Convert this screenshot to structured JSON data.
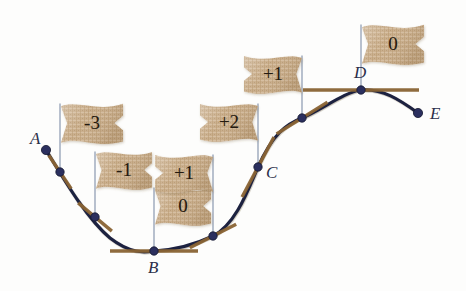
{
  "figure": {
    "background_color": "#fdfdfc",
    "curve_color": "#1d2140",
    "tangent_color": "#8a6434",
    "point_color": "#2b2f5e",
    "pole_color": "#9aa6bb",
    "flag_color": "#c9ad8a",
    "label_color": "#2b2f4a"
  },
  "curve": {
    "name": "slope-curve",
    "path": "M 46 150 C 62 176, 86 218, 110 238 C 132 255, 146 252, 154 251 C 176 250, 196 244, 213 236 C 236 224, 248 190, 258 167 C 272 135, 286 124, 302 118 C 322 110, 344 92, 361 90 C 382 88, 400 100, 418 113",
    "stroke_width": 3.2
  },
  "points": [
    {
      "id": "A",
      "label": "A",
      "x": 46,
      "y": 150,
      "label_x": 30,
      "label_y": 130,
      "slope_flag": null,
      "tangent_len": 0,
      "tangent_angle": 0,
      "endpoint": true
    },
    {
      "id": "P1",
      "label": "",
      "x": 60,
      "y": 172,
      "label_x": 0,
      "label_y": 0,
      "slope_flag": "-3",
      "tangent_len": 20,
      "tangent_angle": 56,
      "endpoint": false
    },
    {
      "id": "P2",
      "label": "",
      "x": 95,
      "y": 217,
      "label_x": 0,
      "label_y": 0,
      "slope_flag": "-1",
      "tangent_len": 22,
      "tangent_angle": 40,
      "endpoint": false
    },
    {
      "id": "B",
      "label": "B",
      "x": 154,
      "y": 251,
      "label_x": 148,
      "label_y": 259,
      "slope_flag": "0",
      "tangent_len": 44,
      "tangent_angle": 0,
      "endpoint": false
    },
    {
      "id": "P3",
      "label": "",
      "x": 213,
      "y": 236,
      "label_x": 0,
      "label_y": 0,
      "slope_flag": "+1",
      "tangent_len": 26,
      "tangent_angle": -27,
      "endpoint": false
    },
    {
      "id": "C",
      "label": "C",
      "x": 258,
      "y": 167,
      "label_x": 266,
      "label_y": 164,
      "slope_flag": "+2",
      "tangent_len": 34,
      "tangent_angle": -62,
      "endpoint": false
    },
    {
      "id": "P4",
      "label": "",
      "x": 302,
      "y": 118,
      "label_x": 0,
      "label_y": 0,
      "slope_flag": "+1",
      "tangent_len": 30,
      "tangent_angle": -32,
      "endpoint": false
    },
    {
      "id": "D",
      "label": "D",
      "x": 361,
      "y": 90,
      "label_x": 354,
      "label_y": 64,
      "slope_flag": "0",
      "tangent_len": 58,
      "tangent_angle": 0,
      "endpoint": false
    },
    {
      "id": "E",
      "label": "E",
      "x": 418,
      "y": 113,
      "label_x": 430,
      "label_y": 105,
      "slope_flag": null,
      "tangent_len": 0,
      "tangent_angle": 0,
      "endpoint": true
    }
  ],
  "flags": [
    {
      "id": "flag-minus3",
      "value": "-3",
      "pole_x": 60,
      "pole_top_y": 104,
      "pole_bottom_y": 172,
      "flag_x": 61,
      "flag_y": 105,
      "flag_w": 62,
      "flag_h": 36,
      "side": "right"
    },
    {
      "id": "flag-minus1",
      "value": "-1",
      "pole_x": 95,
      "pole_top_y": 152,
      "pole_bottom_y": 217,
      "flag_x": 96,
      "flag_y": 153,
      "flag_w": 56,
      "flag_h": 34,
      "side": "right"
    },
    {
      "id": "flag-zero-b",
      "value": "0",
      "pole_x": 154,
      "pole_top_y": 188,
      "pole_bottom_y": 251,
      "flag_x": 155,
      "flag_y": 189,
      "flag_w": 56,
      "flag_h": 34,
      "side": "right"
    },
    {
      "id": "flag-plus1-b",
      "value": "+1",
      "pole_x": 213,
      "pole_top_y": 155,
      "pole_bottom_y": 236,
      "flag_x": 155,
      "flag_y": 156,
      "flag_w": 58,
      "flag_h": 34,
      "side": "left"
    },
    {
      "id": "flag-plus2-c",
      "value": "+2",
      "pole_x": 258,
      "pole_top_y": 104,
      "pole_bottom_y": 167,
      "flag_x": 200,
      "flag_y": 105,
      "flag_w": 58,
      "flag_h": 34,
      "side": "left"
    },
    {
      "id": "flag-plus1-c",
      "value": "+1",
      "pole_x": 302,
      "pole_top_y": 56,
      "pole_bottom_y": 118,
      "flag_x": 244,
      "flag_y": 57,
      "flag_w": 58,
      "flag_h": 34,
      "side": "left"
    },
    {
      "id": "flag-zero-d",
      "value": "0",
      "pole_x": 361,
      "pole_top_y": 25,
      "pole_bottom_y": 90,
      "flag_x": 362,
      "flag_y": 26,
      "flag_w": 62,
      "flag_h": 36,
      "side": "right"
    }
  ]
}
